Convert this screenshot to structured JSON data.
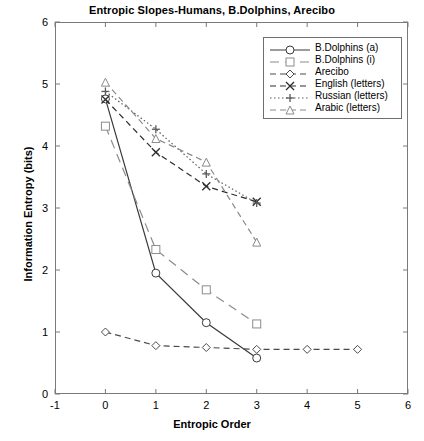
{
  "chart_data": {
    "type": "line",
    "title": "Entropic Slopes-Humans, B.Dolphins, Arecibo",
    "xlabel": "Entropic Order",
    "ylabel": "Information Entropy (bits)",
    "xlim": [
      -1,
      6
    ],
    "ylim": [
      0,
      6
    ],
    "xticks": [
      "-1",
      "0",
      "1",
      "2",
      "3",
      "4",
      "5",
      "6"
    ],
    "yticks": [
      "0",
      "1",
      "2",
      "3",
      "4",
      "5",
      "6"
    ],
    "grid": false,
    "legend_position": "upper right",
    "series": [
      {
        "name": "B.Dolphins (a)",
        "marker": "circle",
        "linestyle": "solid",
        "color": "#3a3a3a",
        "x": [
          0,
          1,
          2,
          3
        ],
        "values": [
          4.76,
          1.95,
          1.15,
          0.58
        ]
      },
      {
        "name": "B.Dolphins (i)",
        "marker": "square",
        "linestyle": "longdash",
        "color": "#8c8c8c",
        "x": [
          0,
          1,
          2,
          3
        ],
        "values": [
          4.32,
          2.33,
          1.68,
          1.13
        ]
      },
      {
        "name": "Arecibo",
        "marker": "diamond",
        "linestyle": "dashed",
        "color": "#4a4a4a",
        "x": [
          0,
          1,
          2,
          3,
          4,
          5
        ],
        "values": [
          1.0,
          0.78,
          0.75,
          0.72,
          0.72,
          0.72
        ]
      },
      {
        "name": "English (letters)",
        "marker": "cross",
        "linestyle": "dashed",
        "color": "#2e2e2e",
        "x": [
          0,
          1,
          2,
          3
        ],
        "values": [
          4.75,
          3.9,
          3.35,
          3.1
        ]
      },
      {
        "name": "Russian (letters)",
        "marker": "plus",
        "linestyle": "dotted",
        "color": "#5a5a5a",
        "x": [
          0,
          1,
          2,
          3
        ],
        "values": [
          4.88,
          4.27,
          3.55,
          3.08
        ]
      },
      {
        "name": "Arabic (letters)",
        "marker": "triangle",
        "linestyle": "dashed",
        "color": "#8a8a8a",
        "x": [
          0,
          1,
          2,
          3
        ],
        "values": [
          5.03,
          4.12,
          3.74,
          2.45
        ]
      }
    ]
  }
}
